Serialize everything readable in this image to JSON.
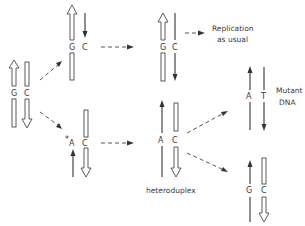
{
  "diagram": {
    "nodes": {
      "original": {
        "left_base": "G",
        "right_base": "C"
      },
      "normal_copy": {
        "left_base": "G",
        "right_base": "C"
      },
      "mispaired_copy": {
        "marker": "*",
        "left_base": "A",
        "right_base": "C"
      },
      "normal_replicated": {
        "left_base": "G",
        "right_base": "C"
      },
      "heteroduplex": {
        "left_base": "A",
        "right_base": "C",
        "caption": "heteroduplex"
      },
      "mutant": {
        "left_base": "A",
        "right_base": "T",
        "caption_line1": "Mutant",
        "caption_line2": "DNA"
      },
      "restored": {
        "left_base": "G",
        "right_base": "C"
      }
    },
    "annotations": {
      "replication_line1": "Replication",
      "replication_line2": "as usual"
    },
    "legend": {
      "hollow_strand": "template strand (hollow arrow)",
      "thin_strand": "newly synthesized strand (thin arrow)"
    }
  }
}
